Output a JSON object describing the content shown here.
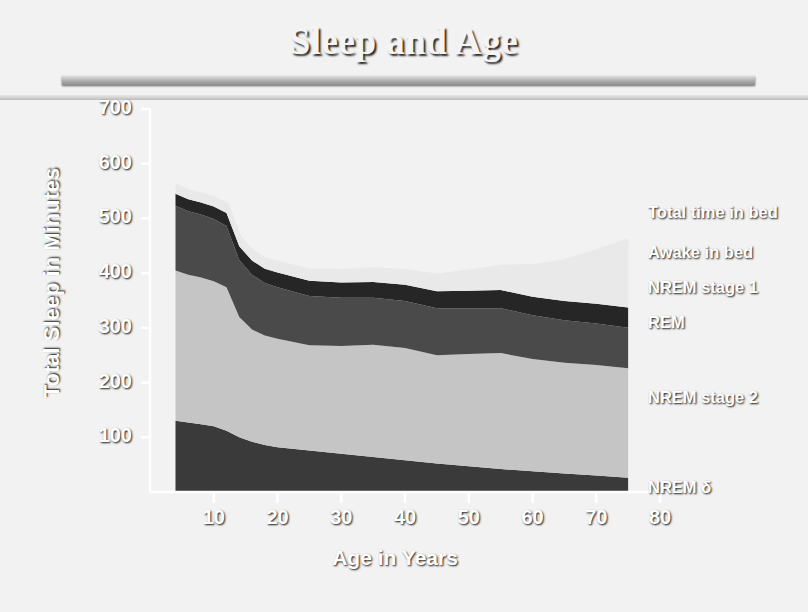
{
  "slide": {
    "title": "Sleep and Age",
    "background_color": "#181818",
    "accent_color": "#dedede"
  },
  "chart_data": {
    "type": "area",
    "stacked": true,
    "title": "Sleep and Age",
    "xlabel": "Age in Years",
    "ylabel": "Total Sleep in Minutes",
    "xlim": [
      0,
      80
    ],
    "ylim": [
      0,
      700
    ],
    "xticks": [
      10,
      20,
      30,
      40,
      50,
      60,
      70,
      80
    ],
    "yticks": [
      100,
      200,
      300,
      400,
      500,
      600,
      700
    ],
    "grid": false,
    "legend_position": "right-outside",
    "x": [
      4,
      6,
      8,
      10,
      12,
      14,
      16,
      18,
      20,
      25,
      30,
      35,
      40,
      45,
      50,
      55,
      60,
      65,
      70,
      75
    ],
    "series": [
      {
        "name": "NREM δ",
        "color": "#3a3a3a",
        "values": [
          130,
          127,
          124,
          120,
          112,
          100,
          92,
          86,
          82,
          76,
          70,
          64,
          58,
          52,
          47,
          42,
          38,
          34,
          30,
          26
        ]
      },
      {
        "name": "NREM stage 2",
        "color": "#c5c5c5",
        "values": [
          275,
          270,
          268,
          265,
          262,
          220,
          205,
          200,
          198,
          192,
          197,
          205,
          205,
          198,
          205,
          212,
          205,
          202,
          202,
          200
        ]
      },
      {
        "name": "REM",
        "color": "#4a4a4a",
        "values": [
          118,
          116,
          115,
          114,
          112,
          104,
          100,
          96,
          94,
          90,
          88,
          86,
          86,
          86,
          84,
          82,
          80,
          78,
          76,
          74
        ]
      },
      {
        "name": "NREM stage 1",
        "color": "#262626",
        "values": [
          22,
          22,
          22,
          23,
          24,
          25,
          26,
          26,
          27,
          28,
          28,
          29,
          30,
          31,
          32,
          33,
          34,
          35,
          36,
          37
        ]
      },
      {
        "name": "Awake in bed",
        "color": "#e9e9e9",
        "values": [
          14,
          14,
          14,
          14,
          15,
          15,
          16,
          16,
          17,
          18,
          20,
          22,
          24,
          28,
          34,
          42,
          55,
          72,
          95,
          122
        ]
      }
    ],
    "total_line": {
      "name": "Total time in bed",
      "color": "#e9e9e9",
      "values": [
        559,
        549,
        543,
        536,
        525,
        464,
        439,
        424,
        418,
        404,
        403,
        406,
        403,
        395,
        402,
        411,
        412,
        421,
        439,
        459
      ]
    },
    "legend": [
      {
        "label": "Total time in bed",
        "color": "#e9e9e9"
      },
      {
        "label": "Awake in bed",
        "color": "#e9e9e9"
      },
      {
        "label": "NREM stage 1",
        "color": "#262626"
      },
      {
        "label": "REM",
        "color": "#4a4a4a"
      },
      {
        "label": "NREM stage 2",
        "color": "#c5c5c5"
      },
      {
        "label": "NREM δ",
        "color": "#3a3a3a"
      }
    ]
  }
}
